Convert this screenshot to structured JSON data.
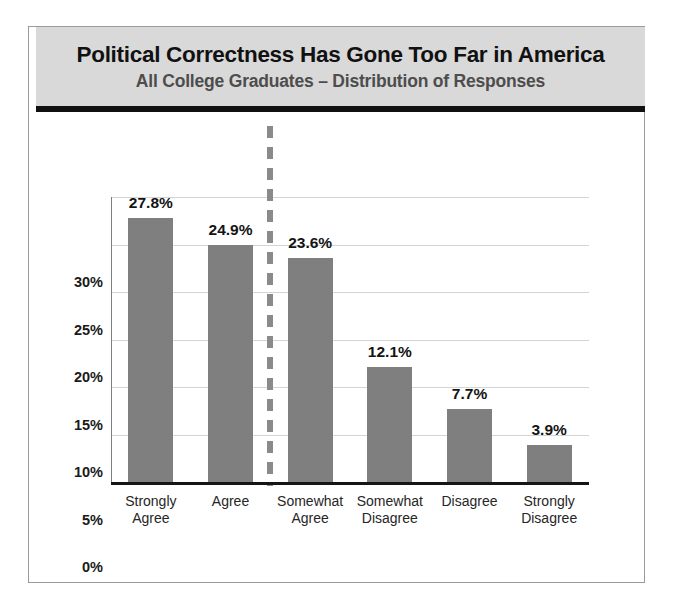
{
  "figure": {
    "title": "Political Correctness Has Gone Too Far in America",
    "subtitle": "All College Graduates – Distribution of Responses"
  },
  "scale": {
    "left_label": "5",
    "right_label": "0",
    "mean_label": "Mean = 3.41",
    "mean_value": 3.41
  },
  "colors": {
    "bar": "#7f7f7f",
    "header_band": "#d9d9d9",
    "header_rule": "#101010",
    "title_text": "#111111",
    "subtitle_text": "#4d4d4d",
    "gridline": "#d4d4d4",
    "axis": "#151515",
    "median_dash": "#8a8a8a",
    "mean_marker": "#7d7d7d"
  },
  "chart_data": {
    "type": "bar",
    "title": "Political Correctness Has Gone Too Far in America",
    "subtitle": "All College Graduates – Distribution of Responses",
    "categories": [
      "Strongly Agree",
      "Agree",
      "Somewhat Agree",
      "Somewhat Disagree",
      "Disagree",
      "Strongly Disagree"
    ],
    "category_lines": [
      [
        "Strongly",
        "Agree"
      ],
      [
        "Agree"
      ],
      [
        "Somewhat",
        "Agree"
      ],
      [
        "Somewhat",
        "Disagree"
      ],
      [
        "Disagree"
      ],
      [
        "Strongly",
        "Disagree"
      ]
    ],
    "values": [
      27.8,
      24.9,
      23.6,
      12.1,
      7.7,
      3.9
    ],
    "data_labels": [
      "27.8%",
      "24.9%",
      "23.6%",
      "12.1%",
      "7.7%",
      "3.9%"
    ],
    "xlabel": "",
    "ylabel": "",
    "ylim": [
      0,
      30
    ],
    "yticks": [
      0,
      5,
      10,
      15,
      20,
      25,
      30
    ],
    "ytick_labels": [
      "0%",
      "5%",
      "10%",
      "15%",
      "20%",
      "25%",
      "30%"
    ],
    "grid": true,
    "legend": null,
    "annotations": [
      {
        "type": "vertical-dashed-line",
        "label": "",
        "between": [
          "Agree",
          "Somewhat Agree"
        ]
      },
      {
        "type": "mean-marker",
        "label": "Mean = 3.41",
        "value": 3.41,
        "scale_from": 5,
        "scale_to": 0
      }
    ]
  }
}
